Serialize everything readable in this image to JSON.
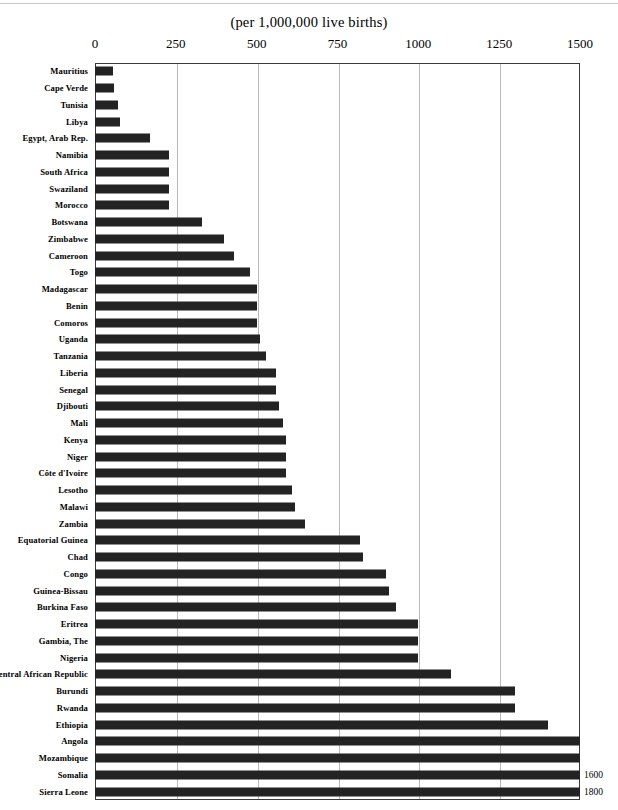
{
  "chart_data": {
    "type": "bar",
    "orientation": "horizontal",
    "title": "(per 1,000,000 live births)",
    "xlabel": "",
    "ylabel": "",
    "xlim": [
      0,
      1500
    ],
    "xticks": [
      0,
      250,
      500,
      750,
      1000,
      1250,
      1500
    ],
    "xtick_labels": [
      "0",
      "250",
      "500",
      "750",
      "1000",
      "1250",
      "1500"
    ],
    "grid": true,
    "legend": null,
    "bar_color": "#232323",
    "categories": [
      "Mauritius",
      "Cape Verde",
      "Tunisia",
      "Libya",
      "Egypt,  Arab Rep.",
      "Namibia",
      "South Africa",
      "Swaziland",
      "Morocco",
      "Botswana",
      "Zimbabwe",
      "Cameroon",
      "Togo",
      "Madagascar",
      "Benin",
      "Comoros",
      "Uganda",
      "Tanzania",
      "Liberia",
      "Senegal",
      "Djibouti",
      "Mali",
      "Kenya",
      "Niger",
      "Côte d'Ivoire",
      "Lesotho",
      "Malawi",
      "Zambia",
      "Equatorial Guinea",
      "Chad",
      "Congo",
      "Guinea-Bissau",
      "Burkina Faso",
      "Eritrea",
      "Gambia, The",
      "Nigeria",
      "Central African Republic",
      "Burundi",
      "Rwanda",
      "Ethiopia",
      "Angola",
      "Mozambique",
      "Somalia",
      "Sierra Leone"
    ],
    "values": [
      55,
      60,
      70,
      77,
      170,
      230,
      230,
      230,
      230,
      330,
      400,
      430,
      480,
      500,
      500,
      500,
      510,
      530,
      560,
      560,
      570,
      580,
      590,
      590,
      590,
      610,
      620,
      650,
      820,
      830,
      900,
      910,
      930,
      1000,
      1000,
      1000,
      1100,
      1300,
      1300,
      1400,
      1500,
      1500,
      1600,
      1800
    ],
    "value_labels": [
      "",
      "",
      "",
      "",
      "",
      "",
      "",
      "",
      "",
      "",
      "",
      "",
      "",
      "",
      "",
      "",
      "",
      "",
      "",
      "",
      "",
      "",
      "",
      "",
      "",
      "",
      "",
      "",
      "",
      "",
      "",
      "",
      "",
      "",
      "",
      "",
      "",
      "",
      "",
      "",
      "",
      "",
      "1600",
      "1800"
    ]
  }
}
